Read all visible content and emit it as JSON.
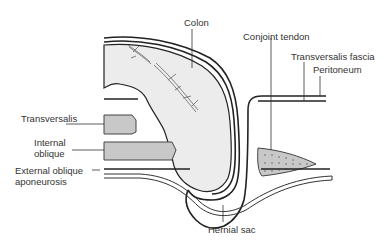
{
  "figure": {
    "type": "anatomical-diagram"
  },
  "labels": {
    "colon": "Colon",
    "conjoint_tendon": "Conjoint tendon",
    "transversalis_fascia": "Transversalis fascia",
    "peritoneum": "Peritoneum",
    "transversalis": "Transversalis",
    "internal_oblique_1": "Internal",
    "internal_oblique_2": "oblique",
    "external_oblique_1": "External oblique",
    "external_oblique_2": "aponeurosis",
    "hernial_sac": "Hernial sac"
  },
  "colors": {
    "line": "#222222",
    "colon_fill": "#ececec",
    "muscle_fill": "#c8c8c8",
    "background": "#ffffff"
  }
}
